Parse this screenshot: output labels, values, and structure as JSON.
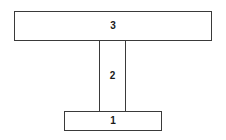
{
  "diagram": {
    "type": "t-section-cross-section",
    "background_color": "#ffffff",
    "line_color": "#3a3a3a",
    "label_color": "#1a1a1a",
    "regions": [
      {
        "id": "top-flange",
        "label": "3",
        "shape": "rectangle",
        "x": 14,
        "y": 11,
        "width": 198,
        "height": 30
      },
      {
        "id": "web",
        "label": "2",
        "shape": "rectangle",
        "x": 99,
        "y": 41,
        "width": 27,
        "height": 70
      },
      {
        "id": "bottom-flange",
        "label": "1",
        "shape": "rectangle",
        "x": 64,
        "y": 111,
        "width": 98,
        "height": 20
      }
    ]
  }
}
